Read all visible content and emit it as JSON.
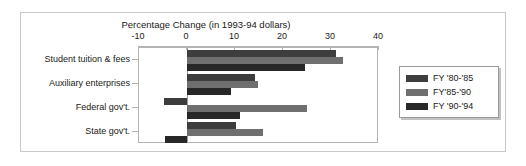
{
  "chart_data": {
    "type": "bar",
    "orientation": "horizontal",
    "title": "Percentage Change (in 1993-94 dollars)",
    "xlabel": "",
    "ylabel": "",
    "xlim": [
      -10,
      40
    ],
    "xticks": [
      -10,
      0,
      10,
      20,
      30,
      40
    ],
    "xticklabels": [
      "-10",
      "0",
      "10",
      "20",
      "30",
      "40"
    ],
    "grid": false,
    "legend_position": "right",
    "categories": [
      "Student tuition & fees",
      "Auxiliary enterprises",
      "Federal gov't.",
      "State gov't."
    ],
    "series": [
      {
        "name": "FY '80-'85",
        "color": "#3d3d3d",
        "values": [
          31.0,
          14.2,
          -4.8,
          10.2
        ]
      },
      {
        "name": "FY'85-'90",
        "color": "#6f6f6f",
        "values": [
          32.5,
          14.8,
          25.0,
          15.8
        ]
      },
      {
        "name": "FY '90-'94",
        "color": "#272727",
        "values": [
          24.5,
          9.2,
          11.0,
          -4.5
        ]
      }
    ]
  },
  "legend": {
    "entries": [
      {
        "label": "FY '80-'85",
        "color": "#3d3d3d"
      },
      {
        "label": "FY'85-'90",
        "color": "#6f6f6f"
      },
      {
        "label": "FY '90-'94",
        "color": "#272727"
      }
    ]
  },
  "colors": {
    "figure_border": "#c8c8c8",
    "axis": "#b4b4b4",
    "zero_line": "#9a9a9a",
    "text": "#1a1a1a",
    "background": "#ffffff"
  }
}
